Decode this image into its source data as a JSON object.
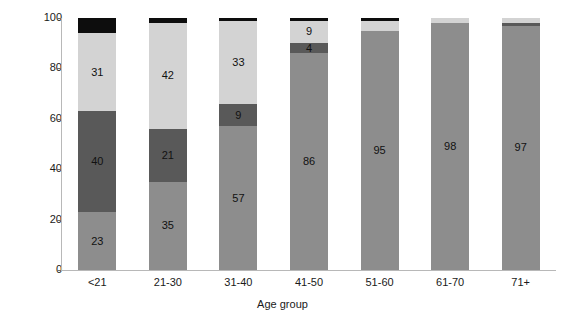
{
  "chart_data": {
    "type": "bar",
    "stacked": true,
    "title": "",
    "xlabel": "Age group",
    "ylabel": "Percentage",
    "ylim": [
      0,
      100
    ],
    "yticks": [
      0,
      20,
      40,
      60,
      80,
      100
    ],
    "grid": false,
    "legend": "none",
    "categories": [
      "<21",
      "21-30",
      "31-40",
      "41-50",
      "51-60",
      "61-70",
      "71+"
    ],
    "series": [
      {
        "name": "series-1",
        "color": "#8d8d8d",
        "values": [
          23,
          35,
          57,
          86,
          95,
          98,
          97
        ],
        "labels": [
          "23",
          "35",
          "57",
          "86",
          "95",
          "98",
          "97"
        ]
      },
      {
        "name": "series-2",
        "color": "#595959",
        "values": [
          40,
          21,
          9,
          4,
          0,
          0,
          1
        ],
        "labels": [
          "40",
          "21",
          "9",
          "4",
          "",
          "",
          ""
        ]
      },
      {
        "name": "series-3",
        "color": "#d3d3d3",
        "values": [
          31,
          42,
          33,
          9,
          4,
          2,
          2
        ],
        "labels": [
          "31",
          "42",
          "33",
          "9",
          "",
          "",
          ""
        ]
      },
      {
        "name": "series-4",
        "color": "#0d0d0d",
        "values": [
          6,
          2,
          1,
          1,
          1,
          0,
          0
        ],
        "labels": [
          "",
          "",
          "",
          "",
          "",
          "",
          ""
        ]
      }
    ]
  },
  "axis": {
    "y_title": "Percentage",
    "x_title": "Age group",
    "y_tick_labels": [
      "0",
      "20",
      "40",
      "60",
      "80",
      "100"
    ]
  }
}
